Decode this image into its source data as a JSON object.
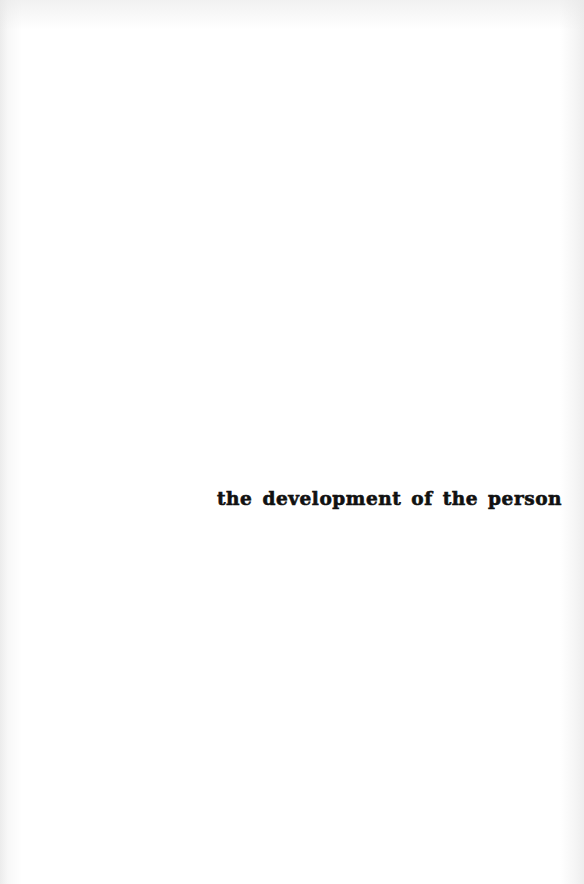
{
  "page": {
    "title": "the development of the person",
    "colors": {
      "background": "#ffffff",
      "text": "#111111"
    }
  }
}
